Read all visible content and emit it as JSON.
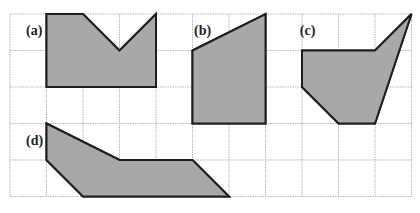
{
  "figure": {
    "grid": {
      "columns": 11,
      "rows": 5,
      "origin_x": 10,
      "origin_y": 14,
      "cell": 36.5,
      "line_color": "#b4b4b4"
    },
    "fill_color": "#a8a8a8",
    "stroke_color": "#1e1e1e",
    "shapes": [
      {
        "id": "a",
        "label": "(a)",
        "label_pos": [
          0.55,
          0.45
        ],
        "vertices": [
          [
            1,
            0
          ],
          [
            2,
            0
          ],
          [
            3,
            1
          ],
          [
            4,
            0
          ],
          [
            4,
            2
          ],
          [
            1,
            2
          ]
        ]
      },
      {
        "id": "b",
        "label": "(b)",
        "label_pos": [
          5.15,
          0.45
        ],
        "vertices": [
          [
            5,
            1
          ],
          [
            7,
            0
          ],
          [
            7,
            3
          ],
          [
            5,
            3
          ]
        ]
      },
      {
        "id": "c",
        "label": "(c)",
        "label_pos": [
          8.05,
          0.45
        ],
        "vertices": [
          [
            8,
            1
          ],
          [
            10,
            1
          ],
          [
            11,
            0
          ],
          [
            10,
            3
          ],
          [
            9,
            3
          ],
          [
            8,
            2
          ]
        ]
      },
      {
        "id": "d",
        "label": "(d)",
        "label_pos": [
          0.55,
          3.45
        ],
        "vertices": [
          [
            1,
            3
          ],
          [
            3,
            4
          ],
          [
            5,
            4
          ],
          [
            6,
            5
          ],
          [
            2,
            5
          ],
          [
            1,
            4
          ]
        ]
      }
    ]
  }
}
